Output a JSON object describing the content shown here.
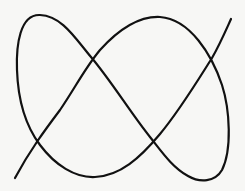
{
  "figure": {
    "stroke_color": "#111111",
    "background_color": "#f7f7f5",
    "stroke_width": 2.2,
    "endpoints": [
      {
        "name": "start-bottom-left",
        "x": 15,
        "y": 178
      },
      {
        "name": "end-top-right",
        "x": 231,
        "y": 19
      }
    ],
    "crossings": [
      {
        "x": 91,
        "y": 57
      },
      {
        "x": 210,
        "y": 59
      },
      {
        "x": 36,
        "y": 136
      },
      {
        "x": 154,
        "y": 140
      }
    ]
  }
}
